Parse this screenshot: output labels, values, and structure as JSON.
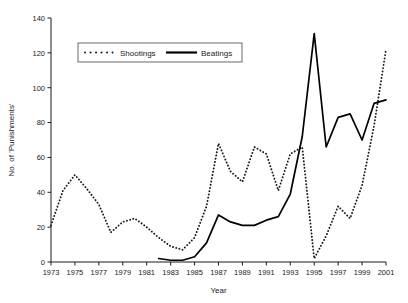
{
  "chart_data": {
    "type": "line",
    "title": "",
    "xlabel": "Year",
    "ylabel": "No. of 'Punishments'",
    "xlim": [
      1973,
      2001
    ],
    "ylim": [
      0,
      140
    ],
    "ytick_step": 20,
    "xtick_step": 2,
    "grid": false,
    "legend_position": "top-left-inside",
    "x": [
      1973,
      1974,
      1975,
      1976,
      1977,
      1978,
      1979,
      1980,
      1981,
      1982,
      1983,
      1984,
      1985,
      1986,
      1987,
      1988,
      1989,
      1990,
      1991,
      1992,
      1993,
      1994,
      1995,
      1996,
      1997,
      1998,
      1999,
      2000,
      2001
    ],
    "xticks": [
      "1973",
      "1975",
      "1977",
      "1979",
      "1981",
      "1983",
      "1985",
      "1987",
      "1989",
      "1991",
      "1993",
      "1995",
      "1997",
      "1999",
      "2001"
    ],
    "yticks": [
      "0",
      "20",
      "40",
      "60",
      "80",
      "100",
      "120",
      "140"
    ],
    "series": [
      {
        "name": "Shootings",
        "style": "dotted",
        "color": "#1a1a1a",
        "values": [
          21,
          41,
          50,
          42,
          33,
          17,
          23,
          25,
          20,
          14,
          9,
          7,
          14,
          32,
          68,
          52,
          46,
          66,
          62,
          41,
          62,
          66,
          2,
          15,
          32,
          25,
          44,
          78,
          122
        ]
      },
      {
        "name": "Beatings",
        "style": "solid",
        "color": "#000000",
        "values": [
          null,
          null,
          null,
          null,
          null,
          null,
          null,
          null,
          null,
          2,
          1,
          1,
          3,
          11,
          27,
          23,
          21,
          21,
          24,
          26,
          39,
          72,
          131,
          66,
          83,
          85,
          70,
          91,
          93
        ]
      }
    ]
  },
  "legend": {
    "items": [
      {
        "label": "Shootings",
        "style": "dotted"
      },
      {
        "label": "Beatings",
        "style": "solid"
      }
    ]
  }
}
